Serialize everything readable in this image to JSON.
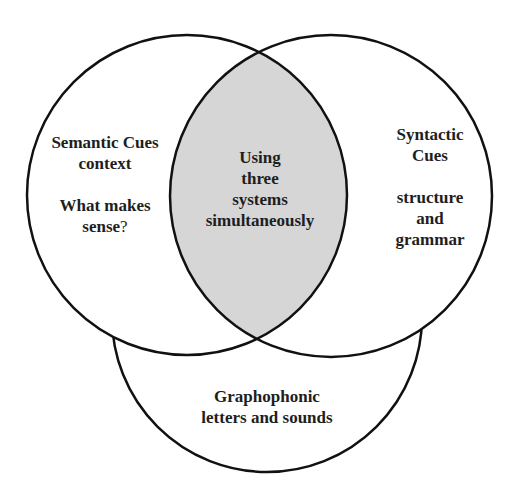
{
  "diagram": {
    "type": "venn",
    "colors": {
      "stroke": "#111111",
      "intersection_fill": "#d6d6d6",
      "background": "#ffffff"
    },
    "circles": [
      {
        "id": "semantic",
        "title": "Semantic Cues",
        "subtitle": "context",
        "note_line1": "What makes",
        "note_line2": "sense",
        "note_suffix": "?"
      },
      {
        "id": "syntactic",
        "title_line1": "Syntactic",
        "title_line2": "Cues",
        "note_line1": "structure",
        "note_line2": "and",
        "note_line3": "grammar"
      },
      {
        "id": "graphophonic",
        "title": "Graphophonic",
        "subtitle": "letters and sounds"
      }
    ],
    "intersection": {
      "line1": "Using",
      "line2": "three",
      "line3": "systems",
      "line4": "simultaneously"
    }
  }
}
